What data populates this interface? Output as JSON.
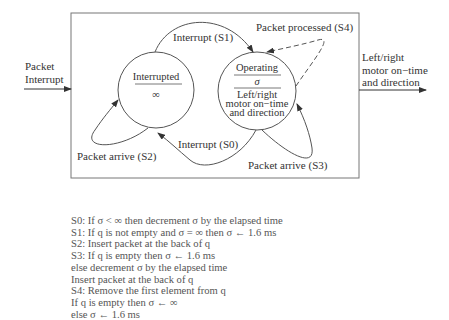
{
  "diagram": {
    "inputs": {
      "left_label_line1": "Packet",
      "left_label_line2": "Interrupt"
    },
    "outputs": {
      "right_label_line1": "Left/right",
      "right_label_line2": "motor on−time",
      "right_label_line3": "and direction"
    },
    "states": [
      {
        "id": "interrupted",
        "name": "Interrupted",
        "value": "∞"
      },
      {
        "id": "operating",
        "name": "Operating",
        "value": "σ",
        "output_line1": "Left/right",
        "output_line2": "motor on−time",
        "output_line3": "and direction"
      }
    ],
    "transitions": {
      "s1": "Interrupt (S1)",
      "s4": "Packet processed (S4)",
      "s0": "Interrupt (S0)",
      "s2": "Packet arrive (S2)",
      "s3": "Packet arrive (S3)"
    }
  },
  "notes": [
    "S0: If σ < ∞ then decrement σ by the elapsed time",
    "S1: If q is not empty and σ = ∞ then σ ← 1.6 ms",
    "S2: Insert packet at the back of q",
    "S3: If q is empty then σ ← 1.6 ms",
    "else decrement σ by the elapsed time",
    "Insert packet at the back of q",
    "S4: Remove the first element from q",
    "If q is empty then σ ← ∞",
    "else σ ← 1.6 ms"
  ]
}
